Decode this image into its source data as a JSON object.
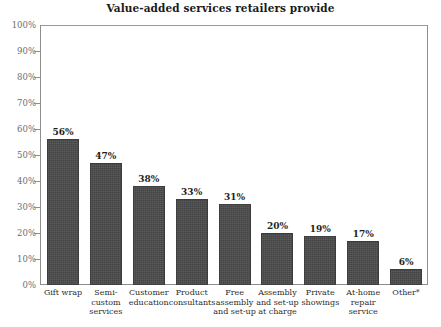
{
  "chart_data": {
    "type": "bar",
    "title": "Value-added services retailers provide",
    "xlabel": "",
    "ylabel": "",
    "ylim": [
      0,
      100
    ],
    "grid": false,
    "legend": "none",
    "orientation": "vertical",
    "bar_color": "#4a4a4a",
    "axis_color": "#8e8e8e",
    "tick_label_color": "#6d6d6d",
    "categories": [
      "Gift wrap",
      "Semi-custom services",
      "Customer education",
      "Product consultants",
      "Free assembly and set-up",
      "Assembly and set-up at charge",
      "Private showings",
      "At-home repair service",
      "Other*"
    ],
    "category_lines": [
      [
        "Gift wrap"
      ],
      [
        "Semi-",
        "custom",
        "services"
      ],
      [
        "Customer",
        "education"
      ],
      [
        "Product",
        "consultants"
      ],
      [
        "Free",
        "assembly",
        "and set-up"
      ],
      [
        "Assembly",
        "and set-up",
        "at charge"
      ],
      [
        "Private",
        "showings"
      ],
      [
        "At-home",
        "repair",
        "service"
      ],
      [
        "Other*"
      ]
    ],
    "values": [
      56,
      47,
      38,
      33,
      31,
      20,
      19,
      17,
      6
    ],
    "value_labels": [
      "56%",
      "47%",
      "38%",
      "33%",
      "31%",
      "20%",
      "19%",
      "17%",
      "6%"
    ],
    "y_ticks": [
      0,
      10,
      20,
      30,
      40,
      50,
      60,
      70,
      80,
      90,
      100
    ],
    "y_tick_labels": [
      "0%",
      "10%",
      "20%",
      "30%",
      "40%",
      "50%",
      "60%",
      "70%",
      "80%",
      "90%",
      "100%"
    ]
  }
}
